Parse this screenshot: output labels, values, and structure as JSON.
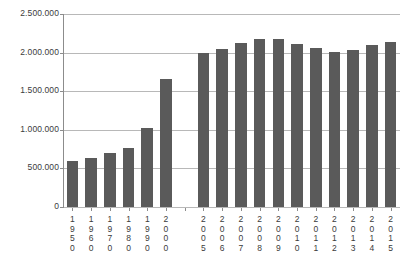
{
  "chart_data": {
    "type": "bar",
    "title": "",
    "subtitle": "",
    "xlabel": "",
    "ylabel": "",
    "categories": [
      "1950",
      "1960",
      "1970",
      "1980",
      "1990",
      "2000",
      "2005",
      "2006",
      "2007",
      "2008",
      "2009",
      "2010",
      "2011",
      "2012",
      "2013",
      "2014",
      "2015"
    ],
    "values": [
      590000,
      640000,
      700000,
      760000,
      1020000,
      1660000,
      1990000,
      2050000,
      2120000,
      2180000,
      2170000,
      2110000,
      2060000,
      2010000,
      2030000,
      2105000,
      2140000
    ],
    "series": [
      {
        "name": "",
        "values": [
          590000,
          640000,
          700000,
          760000,
          1020000,
          1660000,
          1990000,
          2050000,
          2120000,
          2180000,
          2170000,
          2110000,
          2060000,
          2010000,
          2030000,
          2105000,
          2140000
        ]
      }
    ],
    "ylim": [
      0,
      2500000
    ],
    "ytick_values": [
      0,
      500000,
      1000000,
      1500000,
      2000000,
      2500000
    ],
    "ytick_labels": [
      "0",
      "500.000",
      "1.000.000",
      "1.500.000",
      "2.000.000",
      "2.500.000"
    ],
    "grid": true,
    "grid_axis": "y",
    "legend": false,
    "legend_position": "none",
    "bar_color": "#5a5a5a",
    "grid_color": "#b8b8b8",
    "axis_color": "#8c8c8c",
    "background_color": "#ffffff",
    "number_format": "european-dot-thousands",
    "category_gap_after_index": 5,
    "annotations": []
  }
}
